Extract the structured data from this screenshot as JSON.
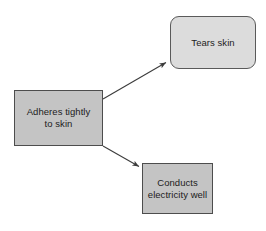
{
  "diagram": {
    "background_color": "#ffffff",
    "nodes": [
      {
        "id": "source",
        "label": "Adheres tightly\nto skin",
        "shape": "rectangle",
        "fill": "#c4c4c4",
        "stroke": "#4d4d4d",
        "x": 14,
        "y": 90,
        "width": 89,
        "height": 56
      },
      {
        "id": "tears",
        "label": "Tears skin",
        "shape": "rounded-rectangle",
        "fill": "#dcdcdc",
        "stroke": "#5a5a5a",
        "x": 170,
        "y": 16,
        "width": 86,
        "height": 53
      },
      {
        "id": "conducts",
        "label": "Conducts\nelectricity well",
        "shape": "rectangle",
        "fill": "#c4c4c4",
        "stroke": "#4d4d4d",
        "x": 142,
        "y": 163,
        "width": 71,
        "height": 51
      }
    ],
    "edges": [
      {
        "id": "edge-source-tears",
        "from": "source",
        "to": "tears",
        "label": "",
        "color": "#3c3c3c",
        "x1": 103,
        "y1": 99,
        "x2": 167,
        "y2": 62
      },
      {
        "id": "edge-source-conducts",
        "from": "source",
        "to": "conducts",
        "label": "",
        "color": "#3c3c3c",
        "x1": 103,
        "y1": 146,
        "x2": 140,
        "y2": 167
      }
    ]
  }
}
